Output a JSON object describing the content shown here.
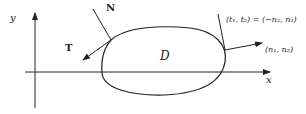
{
  "diagram": {
    "axes": {
      "x_label": "x",
      "y_label": "y"
    },
    "region_label": "D",
    "vectors": {
      "normal_label": "N",
      "tangent_label": "T",
      "tangent_components": "(t₁, t₂) = (−n₂, n₁)",
      "normal_components": "(n₁, n₂)"
    },
    "colors": {
      "stroke": "#222222",
      "background": "#ffffff"
    }
  }
}
